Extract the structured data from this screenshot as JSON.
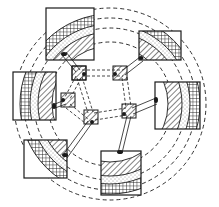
{
  "diagram": {
    "title": "",
    "style": "patent line drawing",
    "colors": {
      "ink": "#1a1a1a",
      "background": "#ffffff"
    },
    "center": [
      110,
      104
    ],
    "rings": [
      {
        "name": "inner-band",
        "fill": "diagonal-hatch",
        "r_inner": 58,
        "r_outer": 72
      },
      {
        "name": "middle-band",
        "fill": "dotted",
        "r_inner": 72,
        "r_outer": 80
      },
      {
        "name": "outer-band",
        "fill": "crosshatch",
        "r_inner": 80,
        "r_outer": 90
      }
    ],
    "dashed_circles": [
      62,
      76,
      86,
      96
    ],
    "outer_blocks": [
      {
        "id": "top-left",
        "x": 46,
        "y": 8,
        "w": 48,
        "h": 52
      },
      {
        "id": "top-right",
        "x": 139,
        "y": 31,
        "w": 42,
        "h": 29
      },
      {
        "id": "left",
        "x": 13,
        "y": 72,
        "w": 43,
        "h": 48
      },
      {
        "id": "right",
        "x": 155,
        "y": 82,
        "w": 45,
        "h": 47
      },
      {
        "id": "bottom-left",
        "x": 24,
        "y": 140,
        "w": 43,
        "h": 38
      },
      {
        "id": "bottom-right",
        "x": 101,
        "y": 151,
        "w": 40,
        "h": 44
      }
    ],
    "nodes": [
      {
        "id": "n1",
        "x": 79,
        "y": 73
      },
      {
        "id": "n2",
        "x": 120,
        "y": 73
      },
      {
        "id": "n3",
        "x": 68,
        "y": 100
      },
      {
        "id": "n4",
        "x": 129,
        "y": 111
      },
      {
        "id": "n5",
        "x": 91,
        "y": 117
      },
      {
        "id": "n6",
        "x": 98,
        "y": 170
      }
    ],
    "links": [
      [
        "n1",
        "n2"
      ],
      [
        "n1",
        "n3"
      ],
      [
        "n2",
        "n4"
      ],
      [
        "n3",
        "n5"
      ],
      [
        "n5",
        "n4"
      ],
      [
        "n1",
        "n5"
      ],
      [
        "n1",
        "top-left"
      ],
      [
        "n2",
        "top-right"
      ],
      [
        "n3",
        "left"
      ],
      [
        "n4",
        "right"
      ],
      [
        "n5",
        "bottom-left"
      ],
      [
        "n4",
        "bottom-right"
      ]
    ]
  }
}
